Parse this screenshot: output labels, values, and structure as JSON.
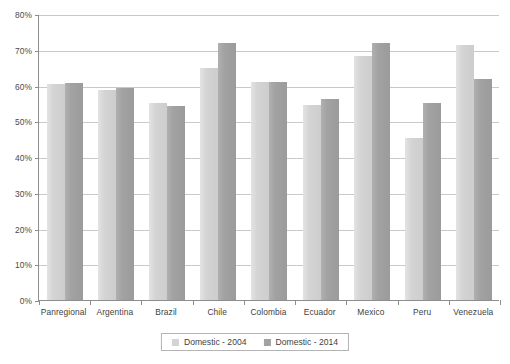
{
  "chart_data": {
    "type": "bar",
    "title": "",
    "subtitle": "",
    "xlabel": "",
    "ylabel": "",
    "categories": [
      "Panregional",
      "Argentina",
      "Brazil",
      "Chile",
      "Colombia",
      "Ecuador",
      "Mexico",
      "Peru",
      "Venezuela"
    ],
    "series": [
      {
        "name": "Domestic - 2004",
        "color": "#d4d4d4",
        "values": [
          60.3,
          58.8,
          55.1,
          64.9,
          61.0,
          54.5,
          68.3,
          45.3,
          71.3
        ]
      },
      {
        "name": "Domestic - 2014",
        "color": "#a2a2a2",
        "values": [
          60.7,
          59.3,
          54.4,
          71.9,
          61.0,
          56.3,
          71.8,
          55.1,
          61.8
        ]
      }
    ],
    "ylim": [
      0,
      80
    ],
    "ytick_values": [
      0,
      10,
      20,
      30,
      40,
      50,
      60,
      70,
      80
    ],
    "ytick_labels": [
      "0%",
      "10%",
      "20%",
      "30%",
      "40%",
      "50%",
      "60%",
      "70%",
      "80%"
    ],
    "grid": true,
    "grid_axis": "y",
    "legend_position": "bottom",
    "annotations": []
  },
  "legend": {
    "items": [
      {
        "label": "Domestic - 2004"
      },
      {
        "label": "Domestic - 2014"
      }
    ]
  }
}
